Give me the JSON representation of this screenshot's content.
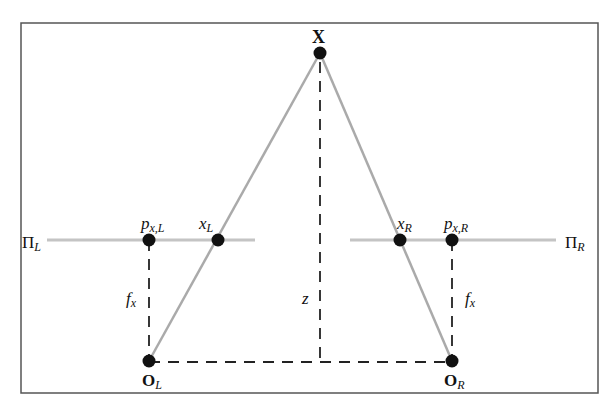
{
  "diagram": {
    "type": "stereo-triangulation",
    "colors": {
      "border": "#555555",
      "ray": "#aaaaaa",
      "image_plane": "#c4c4c4",
      "dashed": "#222222",
      "point": "#111111"
    },
    "labels": {
      "world_point": "X",
      "left_image_plane": {
        "main": "Π",
        "sub": "L"
      },
      "right_image_plane": {
        "main": "Π",
        "sub": "R"
      },
      "left_principal_point": {
        "main": "p",
        "sub": "x,L"
      },
      "right_principal_point": {
        "main": "p",
        "sub": "x,R"
      },
      "left_projection": {
        "main": "x",
        "sub": "L"
      },
      "right_projection": {
        "main": "x",
        "sub": "R"
      },
      "left_focal": {
        "main": "f",
        "sub": "x"
      },
      "right_focal": {
        "main": "f",
        "sub": "x"
      },
      "depth": "z",
      "left_center": {
        "main": "O",
        "sub": "L"
      },
      "right_center": {
        "main": "O",
        "sub": "R"
      }
    }
  }
}
